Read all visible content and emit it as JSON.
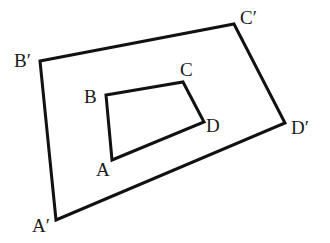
{
  "diagram": {
    "title": "",
    "colors": {
      "stroke": "#111111",
      "label": "#1a1a1a",
      "background": "#ffffff"
    },
    "inner_quadrilateral": {
      "name": "ABCD",
      "vertices": [
        {
          "label": "A",
          "x": 112,
          "y": 160,
          "lx": 96,
          "ly": 176
        },
        {
          "label": "B",
          "x": 106,
          "y": 95,
          "lx": 84,
          "ly": 103
        },
        {
          "label": "C",
          "x": 183,
          "y": 82,
          "lx": 180,
          "ly": 76
        },
        {
          "label": "D",
          "x": 204,
          "y": 122,
          "lx": 206,
          "ly": 132
        }
      ]
    },
    "outer_quadrilateral": {
      "name": "A′B′C′D′",
      "vertices": [
        {
          "label": "A′",
          "x": 56,
          "y": 220,
          "lx": 32,
          "ly": 232
        },
        {
          "label": "B′",
          "x": 40,
          "y": 61,
          "lx": 14,
          "ly": 67
        },
        {
          "label": "C′",
          "x": 234,
          "y": 24,
          "lx": 240,
          "ly": 24
        },
        {
          "label": "D′",
          "x": 285,
          "y": 123,
          "lx": 291,
          "ly": 134
        }
      ]
    }
  }
}
